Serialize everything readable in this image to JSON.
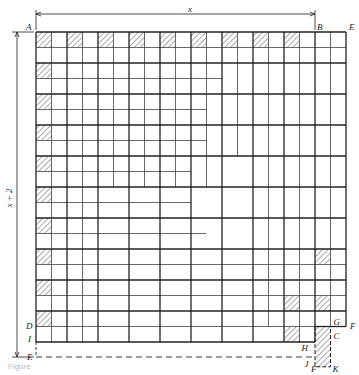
{
  "diagram": {
    "dimensions": {
      "top": "x",
      "left": "x + 2"
    },
    "grid": {
      "cols": 10,
      "rows": 20,
      "origin_x": 36,
      "origin_y": 32,
      "cell_w": 15.5,
      "cell_h": 15.5
    },
    "points": [
      {
        "id": "A",
        "label": "A"
      },
      {
        "id": "B",
        "label": "B"
      },
      {
        "id": "E_top",
        "label": "E"
      },
      {
        "id": "F_right",
        "label": "F"
      },
      {
        "id": "G",
        "label": "G"
      },
      {
        "id": "C",
        "label": "C"
      },
      {
        "id": "H",
        "label": "H"
      },
      {
        "id": "J",
        "label": "J"
      },
      {
        "id": "D",
        "label": "D"
      },
      {
        "id": "I",
        "label": "I"
      },
      {
        "id": "E_bottom",
        "label": "E"
      },
      {
        "id": "F_bottom",
        "label": "F"
      },
      {
        "id": "K",
        "label": "K"
      }
    ],
    "caption": "Figure"
  }
}
